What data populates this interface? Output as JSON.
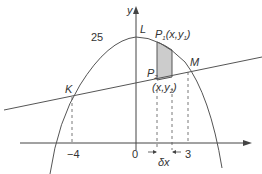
{
  "diagram": {
    "type": "area-between-curve-and-line",
    "colors": {
      "stroke": "#555555",
      "axis": "#444444",
      "strip_fill": "#cccccc",
      "text": "#333333"
    },
    "labels": {
      "y_axis": "y",
      "vertex": "L",
      "curve_value": "25",
      "point_p1": "P",
      "point_p1_sub": "1",
      "point_p1_coords": "(x,y",
      "point_p1_coords_sub": "1",
      "point_p1_coords_close": ")",
      "point_p2": "P",
      "point_p2_sub": "2",
      "point_p2_coords": "(x,y",
      "point_p2_coords_sub": "2",
      "point_p2_coords_close": ")",
      "intersection_left": "K",
      "intersection_right": "M",
      "x_tick_neg4": "−4",
      "x_tick_0": "0",
      "x_tick_3": "3",
      "strip_width": "δx"
    }
  }
}
